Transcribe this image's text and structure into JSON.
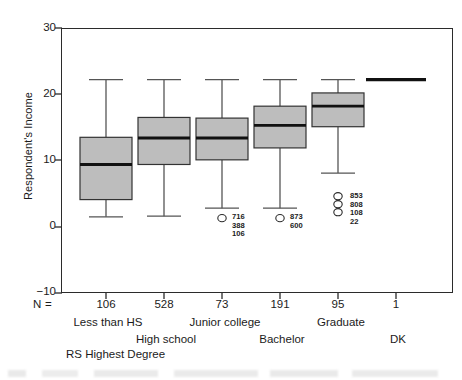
{
  "chart_data": {
    "type": "box",
    "title": "",
    "ylabel": "Respondent's Income",
    "xlabel": "RS Highest Degree",
    "ylim": [
      -10,
      30
    ],
    "yticks": [
      30,
      20,
      10,
      0,
      -10
    ],
    "ytick_labels": [
      "30",
      "20",
      "10",
      "0",
      "−10"
    ],
    "grid": false,
    "n_prefix": "N =",
    "categories": [
      "Less than HS",
      "High school",
      "Junior college",
      "Bachelor",
      "Graduate",
      "DK"
    ],
    "n_values": [
      "106",
      "528",
      "73",
      "191",
      "95",
      "1"
    ],
    "boxes": [
      {
        "category": "Less than HS",
        "n": "106",
        "whisker_low": 1.5,
        "q1": 4.1,
        "median": 9.4,
        "q3": 13.5,
        "whisker_high": 22.2,
        "outliers": [],
        "outlier_labels": []
      },
      {
        "category": "High school",
        "n": "528",
        "whisker_low": 1.6,
        "q1": 9.4,
        "median": 13.4,
        "q3": 16.5,
        "whisker_high": 22.2,
        "outliers": [],
        "outlier_labels": []
      },
      {
        "category": "Junior college",
        "n": "73",
        "whisker_low": 2.8,
        "q1": 10.1,
        "median": 13.4,
        "q3": 16.4,
        "whisker_high": 22.2,
        "outliers": [
          1.3
        ],
        "outlier_labels": [
          "716",
          "388",
          "106"
        ]
      },
      {
        "category": "Bachelor",
        "n": "191",
        "whisker_low": 2.8,
        "q1": 11.9,
        "median": 15.3,
        "q3": 18.2,
        "whisker_high": 22.2,
        "outliers": [
          1.3
        ],
        "outlier_labels": [
          "873",
          "600"
        ]
      },
      {
        "category": "Graduate",
        "n": "95",
        "whisker_low": 8.1,
        "q1": 15.1,
        "median": 18.2,
        "q3": 20.2,
        "whisker_high": 22.2,
        "outliers": [
          4.6,
          3.4,
          2.2
        ],
        "outlier_labels": [
          "853",
          "808",
          "108",
          "22"
        ]
      },
      {
        "category": "DK",
        "n": "1",
        "whisker_low": 22.2,
        "q1": 22.2,
        "median": 22.2,
        "q3": 22.2,
        "whisker_high": 22.2,
        "single_value": 22.2,
        "outliers": [],
        "outlier_labels": []
      }
    ],
    "colors": {
      "box_fill": "#bdbdbd",
      "box_edge": "#333333",
      "median": "#111111",
      "whisker": "#555555",
      "frame": "#2b2b2b",
      "text": "#1b1b1b"
    }
  }
}
